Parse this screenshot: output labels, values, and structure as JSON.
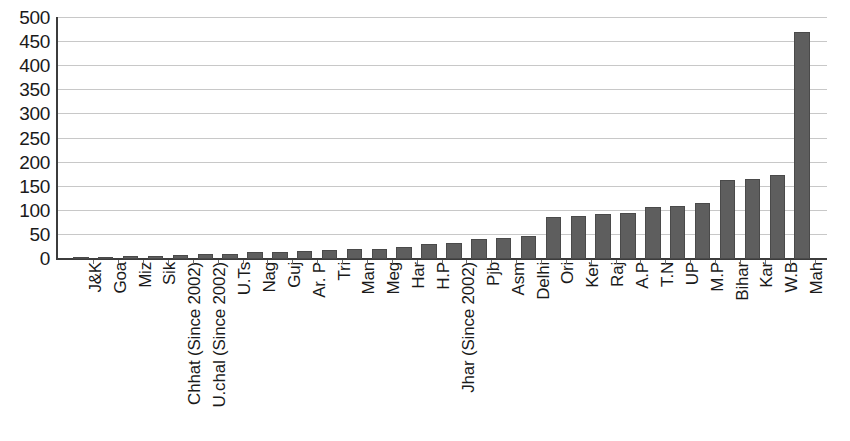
{
  "chart_data": {
    "type": "bar",
    "title": "",
    "subtitle": "",
    "xlabel": "",
    "ylabel": "",
    "ylim": [
      0,
      500
    ],
    "ytick_step": 50,
    "ytick_labels": [
      "500",
      "450",
      "400",
      "350",
      "300",
      "250",
      "200",
      "150",
      "100",
      "50",
      "0"
    ],
    "ytick_values": [
      500,
      450,
      400,
      350,
      300,
      250,
      200,
      150,
      100,
      50,
      0
    ],
    "grid": true,
    "grid_axis": "y",
    "legend": false,
    "legend_position": "none",
    "bar_color": "#5e5e5e",
    "bar_edge_color": "#4a4a4a",
    "axis_color": "#3c3c3c",
    "gridline_color": "#c8c8c8",
    "categories": [
      "J&K",
      "Goa",
      "Miz",
      "Sik",
      "Chhat (Since 2002)",
      "U.chal (Since 2002)",
      "U.Ts",
      "Nag",
      "Guj",
      "Ar. P",
      "Tri",
      "Man",
      "Meg",
      "Har",
      "H.P",
      "Jhar (Since 2002)",
      "Pjb",
      "Asm",
      "Delhi",
      "Ori",
      "Ker",
      "Raj",
      "A.P",
      "T.N",
      "UP",
      "M.P",
      "Bihar",
      "Kar",
      "W.B",
      "Mah"
    ],
    "values": [
      1,
      2,
      6,
      6,
      9,
      10,
      11,
      14,
      15,
      17,
      19,
      20,
      21,
      24,
      32,
      33,
      41,
      44,
      48,
      88,
      90,
      93,
      96,
      108,
      111,
      117,
      163,
      165,
      175,
      470
    ]
  }
}
